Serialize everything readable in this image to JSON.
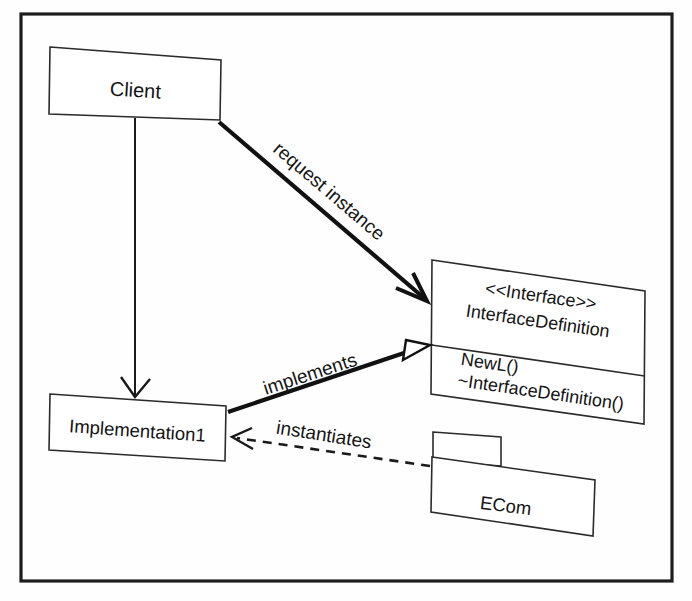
{
  "diagram": {
    "frame": {
      "name": "diagram-frame"
    },
    "nodes": {
      "client": {
        "id": "client",
        "label": "Client",
        "kind": "class"
      },
      "implementation": {
        "id": "implementation1",
        "label": "Implementation1",
        "kind": "class"
      },
      "interface": {
        "id": "interface-definition",
        "stereotype": "<<Interface>>",
        "name": "InterfaceDefinition",
        "kind": "interface",
        "operations": [
          "NewL()",
          "~InterfaceDefinition()"
        ]
      },
      "ecom": {
        "id": "ecom",
        "label": "ECom",
        "kind": "package"
      }
    },
    "edges": [
      {
        "id": "request-instance",
        "label": "request instance",
        "from": "client",
        "to": "interface-definition",
        "style": "solid",
        "arrow": "open",
        "label_rotation": 31
      },
      {
        "id": "implements",
        "label": "implements",
        "from": "implementation1",
        "to": "interface-definition",
        "style": "solid",
        "arrow": "hollow-triangle",
        "label_rotation": -15
      },
      {
        "id": "instantiates",
        "label": "instantiates",
        "from": "ecom",
        "to": "implementation1",
        "style": "dashed",
        "arrow": "open",
        "label_rotation": 9
      },
      {
        "id": "client-uses-implementation",
        "label": "",
        "from": "client",
        "to": "implementation1",
        "style": "solid",
        "arrow": "open",
        "label_rotation": 0
      }
    ]
  },
  "colors": {
    "background": "#fefefe",
    "line": "#1a1a1a",
    "box_fill": "#ffffff",
    "text": "#141414",
    "frame": "#1d1d1d"
  }
}
